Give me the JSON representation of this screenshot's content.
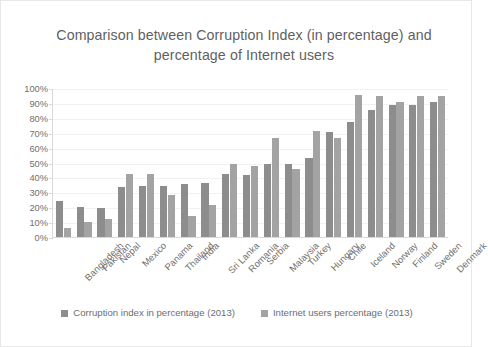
{
  "chart_data": {
    "type": "bar",
    "title": "Comparison between Corruption Index (in percentage)  and percentage of Internet users",
    "xlabel": "",
    "ylabel": "",
    "ylim": [
      0,
      100
    ],
    "y_ticks": [
      "0%",
      "10%",
      "20%",
      "30%",
      "40%",
      "50%",
      "60%",
      "70%",
      "80%",
      "90%",
      "100%"
    ],
    "grid": true,
    "legend_position": "bottom",
    "categories": [
      "Bangladesh",
      "Pakistan",
      "Nepal",
      "Mexico",
      "Panama",
      "Thailand",
      "India",
      "Sri Lanka",
      "Romania",
      "Serbia",
      "Malaysia",
      "Turkey",
      "Hungary",
      "Chile",
      "Iceland",
      "Norway",
      "Finland",
      "Sweden",
      "Denmark"
    ],
    "series": [
      {
        "name": "Corruption index in percentage (2013)",
        "color": "#8d8d8d",
        "values": [
          25,
          21,
          20,
          34,
          35,
          35,
          36,
          37,
          43,
          42,
          50,
          50,
          54,
          71,
          78,
          86,
          89,
          89,
          91
        ]
      },
      {
        "name": "Internet users percentage (2013)",
        "color": "#a3a3a3",
        "values": [
          7,
          11,
          13,
          43,
          43,
          29,
          15,
          22,
          50,
          48,
          67,
          46,
          72,
          67,
          96,
          95,
          91,
          95,
          95
        ]
      }
    ]
  },
  "legend": {
    "entries": [
      {
        "label": "Corruption index in percentage (2013)"
      },
      {
        "label": "Internet users percentage (2013)"
      }
    ]
  }
}
